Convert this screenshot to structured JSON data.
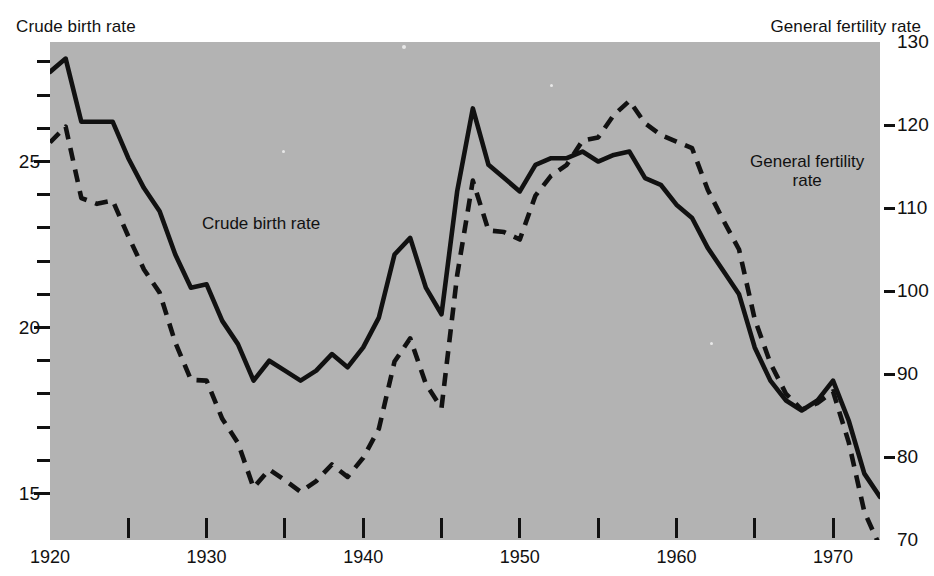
{
  "header": {
    "left_caption": "Crude birth rate",
    "right_caption": "General fertility rate"
  },
  "annotations": {
    "crude": "Crude birth rate",
    "gfr_line1": "General fertility",
    "gfr_line2": "rate"
  },
  "chart_data": {
    "type": "line",
    "title": "",
    "subtitle": "",
    "xlabel": "",
    "ylabel": "Crude birth rate",
    "y2label": "General fertility rate",
    "grid": false,
    "legend_position": "inline-annotation",
    "xlim": [
      1920,
      1973
    ],
    "xticks": [
      1920,
      1925,
      1930,
      1935,
      1940,
      1945,
      1950,
      1955,
      1960,
      1965,
      1970
    ],
    "xticklabels": [
      "1920",
      "",
      "1930",
      "",
      "1940",
      "",
      "1950",
      "",
      "1960",
      "",
      "1970"
    ],
    "ylim": [
      13.6,
      28.6
    ],
    "yticks": [
      15,
      16,
      17,
      18,
      19,
      20,
      21,
      22,
      23,
      24,
      25,
      26,
      27,
      28
    ],
    "yticklabels": [
      "15",
      "",
      "",
      "",
      "",
      "20",
      "",
      "",
      "",
      "",
      "25",
      "",
      "",
      ""
    ],
    "y2lim": [
      70,
      130
    ],
    "y2ticks": [
      70,
      80,
      90,
      100,
      110,
      120,
      130
    ],
    "y2ticklabels": [
      "70",
      "80",
      "90",
      "100",
      "110",
      "120",
      "130"
    ],
    "x": [
      1920,
      1921,
      1922,
      1923,
      1924,
      1925,
      1926,
      1927,
      1928,
      1929,
      1930,
      1931,
      1932,
      1933,
      1934,
      1935,
      1936,
      1937,
      1938,
      1939,
      1940,
      1941,
      1942,
      1943,
      1944,
      1945,
      1946,
      1947,
      1948,
      1949,
      1950,
      1951,
      1952,
      1953,
      1954,
      1955,
      1956,
      1957,
      1958,
      1959,
      1960,
      1961,
      1962,
      1963,
      1964,
      1965,
      1966,
      1967,
      1968,
      1969,
      1970,
      1971,
      1972,
      1973
    ],
    "series": [
      {
        "name": "Crude birth rate",
        "axis": "left",
        "style": "solid",
        "color": "#111111",
        "values": [
          27.7,
          28.1,
          26.2,
          26.2,
          26.2,
          25.1,
          24.2,
          23.5,
          22.2,
          21.2,
          21.3,
          20.2,
          19.5,
          18.4,
          19.0,
          18.7,
          18.4,
          18.7,
          19.2,
          18.8,
          19.4,
          20.3,
          22.2,
          22.7,
          21.2,
          20.4,
          24.1,
          26.6,
          24.9,
          24.5,
          24.1,
          24.9,
          25.1,
          25.1,
          25.3,
          25.0,
          25.2,
          25.3,
          24.5,
          24.3,
          23.7,
          23.3,
          22.4,
          21.7,
          21.0,
          19.4,
          18.4,
          17.8,
          17.5,
          17.8,
          18.4,
          17.2,
          15.6,
          14.9
        ]
      },
      {
        "name": "General fertility rate",
        "axis": "right",
        "style": "dashed",
        "color": "#111111",
        "values": [
          117.9,
          119.8,
          111.2,
          110.5,
          110.9,
          106.6,
          102.6,
          99.8,
          93.8,
          89.3,
          89.2,
          84.6,
          81.7,
          76.3,
          78.5,
          77.2,
          75.8,
          77.1,
          79.1,
          77.6,
          79.9,
          83.4,
          91.5,
          94.3,
          88.8,
          85.9,
          101.9,
          113.3,
          107.3,
          107.1,
          106.2,
          111.5,
          113.9,
          115.2,
          118.1,
          118.5,
          121.2,
          122.9,
          120.2,
          118.8,
          118.0,
          117.2,
          112.2,
          108.5,
          105.0,
          96.6,
          91.3,
          87.6,
          85.7,
          86.5,
          87.9,
          81.8,
          73.4,
          69.2
        ]
      }
    ]
  }
}
